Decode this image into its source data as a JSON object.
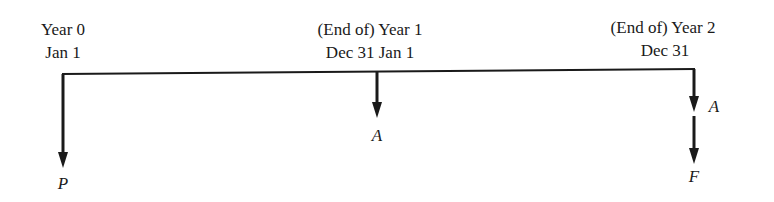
{
  "diagram": {
    "type": "cash-flow-timeline",
    "points": [
      {
        "id": "year0",
        "line1": "Year 0",
        "line2": "Jan 1",
        "flow_label": "P"
      },
      {
        "id": "year1",
        "line1": "(End of) Year 1",
        "line2": "Dec 31 Jan 1",
        "flow_label": "A"
      },
      {
        "id": "year2",
        "line1": "(End of) Year 2",
        "line2": "Dec 31",
        "flow_label_upper": "A",
        "flow_label_lower": "F"
      }
    ],
    "line_color": "#1a1a1a"
  }
}
